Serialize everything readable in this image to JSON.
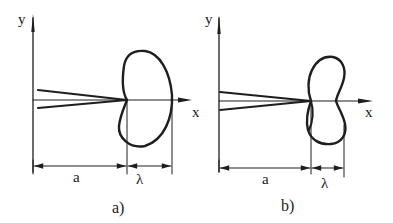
{
  "panels": [
    {
      "id": "a",
      "caption": "a)",
      "axis_labels": {
        "x": "x",
        "y": "y"
      },
      "dimension_labels": {
        "distance": "a",
        "wavelength": "λ"
      },
      "lobe_type": "single asymmetric lobe (cardioid-like)"
    },
    {
      "id": "b",
      "caption": "b)",
      "axis_labels": {
        "x": "x",
        "y": "y"
      },
      "dimension_labels": {
        "distance": "a",
        "wavelength": "λ"
      },
      "lobe_type": "two-lobed (figure-eight) pattern"
    }
  ],
  "colors": {
    "ink": "#1e1e1e",
    "background": "#ffffff"
  }
}
